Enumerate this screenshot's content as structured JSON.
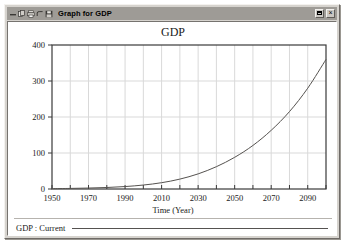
{
  "window": {
    "title": "Graph for GDP",
    "titlebar_icons": [
      "minimize-icon",
      "copy-icon",
      "print-icon",
      "undo-icon",
      "save-icon"
    ],
    "buttons": {
      "restore_label": "",
      "close_label": "×"
    },
    "colors": {
      "titlebar": "#9e9b96",
      "frame": "#d6d3ce",
      "client": "#ffffff",
      "curve": "#55524f",
      "grid": "#d9d9d9",
      "axis": "#3a3a3a"
    }
  },
  "chart_data": {
    "type": "line",
    "title": "GDP",
    "xlabel": "Time (Year)",
    "ylabel": "",
    "xlim": [
      1950,
      2100
    ],
    "ylim": [
      0,
      400
    ],
    "grid": true,
    "legend_position": "bottom-left",
    "xticks": [
      1950,
      1970,
      1990,
      2010,
      2030,
      2050,
      2070,
      2090
    ],
    "yticks": [
      0,
      100,
      200,
      300,
      400
    ],
    "x_gridline_step": 10,
    "series": [
      {
        "name": "GDP : Current",
        "x": [
          1950,
          1960,
          1970,
          1980,
          1990,
          2000,
          2010,
          2020,
          2030,
          2040,
          2050,
          2060,
          2070,
          2080,
          2090,
          2100
        ],
        "values": [
          1,
          1.6,
          2.6,
          4.2,
          6.8,
          11,
          17.5,
          27.5,
          42,
          62,
          88,
          121,
          163,
          215,
          280,
          360
        ]
      }
    ]
  }
}
